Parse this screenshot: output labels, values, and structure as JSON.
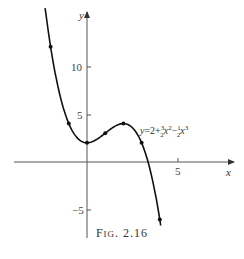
{
  "chart_data": {
    "type": "line",
    "title": "",
    "caption": "FIG. 2.16",
    "xlabel": "x",
    "ylabel": "y",
    "x_ticks": [
      5
    ],
    "y_ticks": [
      -5,
      5,
      10
    ],
    "xlim": [
      -4.8,
      6.2
    ],
    "ylim": [
      -7.5,
      15
    ],
    "grid": false,
    "equation_label": "y = 2 + (3/2)x² − (1/2)x³",
    "series": [
      {
        "name": "y = 2 + 3/2 x^2 - 1/2 x^3",
        "x": [
          -2,
          -1,
          0,
          1,
          2,
          3,
          4
        ],
        "y": [
          12,
          4,
          2,
          3,
          4,
          2,
          -6
        ],
        "markers": true
      }
    ]
  },
  "labels": {
    "y_axis": "y",
    "x_axis": "x",
    "tick_x_5": "5",
    "tick_y_10": "10",
    "tick_y_5": "5",
    "tick_y_neg5": "−5",
    "eq_prefix": "y=2+",
    "caption_f": "F",
    "caption_rest": "IG",
    "caption_num": ". 2.16"
  }
}
